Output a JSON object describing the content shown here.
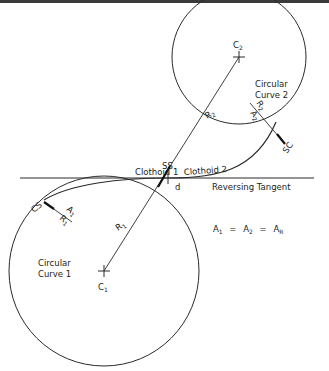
{
  "diagram": {
    "labels": {
      "circular_curve_1_line1": "Circular",
      "circular_curve_1_line2": "Curve 1",
      "circular_curve_2_line1": "Circular",
      "circular_curve_2_line2": "Curve 2",
      "center_1": "C",
      "center_1_sub": "1",
      "center_2": "C",
      "center_2_sub": "2",
      "radius_1": "R",
      "radius_1_sub": "1",
      "radius_2": "R",
      "radius_2_sub": "2",
      "clothoid_1": "Clothoid 1",
      "clothoid_2": "Clothoid 2",
      "ss": "SS",
      "d": "d",
      "reversing_tangent": "Reversing Tangent",
      "cs": "CS",
      "sc": "SC",
      "a1": "A",
      "a1_sub": "1",
      "r1_small": "R",
      "r1_small_sub": "1",
      "a2": "A",
      "a2_sub": "2",
      "r2_small": "R",
      "r2_small_sub": "2",
      "equation_a1": "A",
      "equation_a1_sub": "1",
      "equation_eq1": "=",
      "equation_a2": "A",
      "equation_a2_sub": "2",
      "equation_eq2": "=",
      "equation_ar": "A",
      "equation_ar_sub": "R"
    },
    "colors": {
      "line": "#2a2a2a",
      "background": "#ffffff"
    }
  }
}
